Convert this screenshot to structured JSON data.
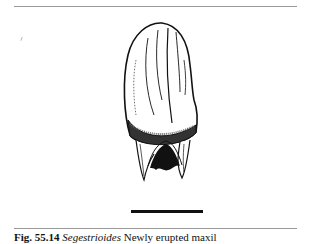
{
  "figure": {
    "scale_bar": true
  },
  "caption": {
    "label": "Fig. 55.14",
    "taxon": "Segestrioides",
    "text": "Newly erupted maxil"
  },
  "colors": {
    "ink": "#111111",
    "rule": "#9a9a9a",
    "background": "#ffffff"
  }
}
